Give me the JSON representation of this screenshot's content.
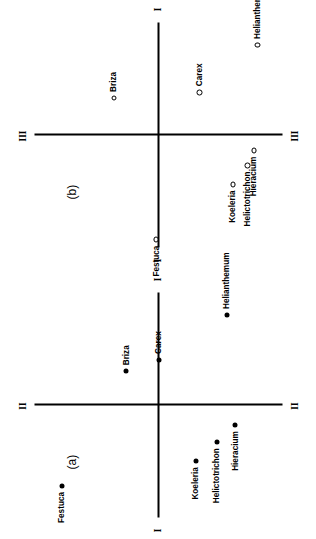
{
  "figure": {
    "orientation_deg": -90,
    "background": "#ffffff",
    "ink": "#000000"
  },
  "chart_data": {
    "type": "scatter",
    "title": "",
    "subtitle": "",
    "grid": false,
    "legend": "none",
    "panels": [
      {
        "tag": "(a)",
        "marker_style": "filled-circle",
        "xlabel": "I",
        "ylabel": "II",
        "axis_end_labels": {
          "x_left": "I",
          "x_right": "I",
          "y_top": "II",
          "y_bottom": "II"
        },
        "xlim": [
          -1.0,
          1.0
        ],
        "ylim": [
          -1.0,
          1.0
        ],
        "points": [
          {
            "name": "Festuca",
            "x": -0.72,
            "y": 0.78,
            "label_side": "left"
          },
          {
            "name": "Koeleria",
            "x": -0.5,
            "y": -0.3,
            "label_side": "left"
          },
          {
            "name": "Helictotrichon",
            "x": -0.33,
            "y": -0.47,
            "label_side": "left"
          },
          {
            "name": "Hieracium",
            "x": -0.18,
            "y": -0.62,
            "label_side": "left"
          },
          {
            "name": "Briza",
            "x": 0.3,
            "y": 0.26,
            "label_side": "right"
          },
          {
            "name": "Carex",
            "x": 0.4,
            "y": 0.0,
            "label_side": "right"
          },
          {
            "name": "Helianthemum",
            "x": 0.8,
            "y": -0.55,
            "label_side": "right"
          }
        ]
      },
      {
        "tag": "(b)",
        "marker_style": "open-circle",
        "xlabel": "I",
        "ylabel": "III",
        "axis_end_labels": {
          "x_left": "I",
          "x_right": "I",
          "y_top": "III",
          "y_bottom": "III"
        },
        "xlim": [
          -1.0,
          1.0
        ],
        "ylim": [
          -1.0,
          1.0
        ],
        "points": [
          {
            "name": "Festuca",
            "x": -0.93,
            "y": 0.02,
            "label_side": "left"
          },
          {
            "name": "Koeleria",
            "x": -0.44,
            "y": -0.6,
            "label_side": "left"
          },
          {
            "name": "Helictotrichon",
            "x": -0.27,
            "y": -0.72,
            "label_side": "left"
          },
          {
            "name": "Hieracium",
            "x": -0.14,
            "y": -0.77,
            "label_side": "left"
          },
          {
            "name": "Briza",
            "x": 0.33,
            "y": 0.36,
            "label_side": "right"
          },
          {
            "name": "Carex",
            "x": 0.38,
            "y": -0.33,
            "label_side": "right"
          },
          {
            "name": "Helianthemum",
            "x": 0.8,
            "y": -0.8,
            "label_side": "right"
          }
        ]
      }
    ],
    "species": [
      "Festuca",
      "Koeleria",
      "Helictotrichon",
      "Hieracium",
      "Briza",
      "Carex",
      "Helianthemum"
    ],
    "axes_named": [
      "I",
      "II",
      "III"
    ]
  }
}
